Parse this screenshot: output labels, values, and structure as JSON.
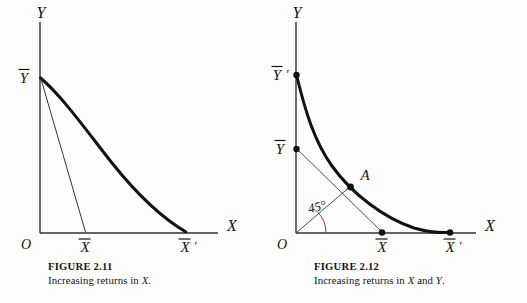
{
  "page": {
    "background": "#fdfdfc",
    "ink": "#141414"
  },
  "figures": [
    {
      "id": "figure-2-11",
      "caption_title": "FIGURE 2.11",
      "caption_text_pre": "Increasing returns in ",
      "caption_text_italic": "X",
      "caption_text_post": ".",
      "axes": {
        "y_axis_label": "Y",
        "x_axis_label": "X",
        "origin_label": "O"
      },
      "ticks": {
        "y": [
          {
            "name": "y-bar",
            "label": "Ȳ",
            "latex": "\\bar{Y}",
            "value": 1.0,
            "dot": false
          }
        ],
        "x": [
          {
            "name": "x-bar",
            "label": "X̄",
            "latex": "\\bar{X}",
            "value": 0.31,
            "dot": false
          },
          {
            "name": "x-bar-prime",
            "label": "X̄'",
            "latex": "\\bar{X}'",
            "value": 1.0,
            "dot": false
          }
        ]
      },
      "curves": [
        {
          "name": "isoquant-curve",
          "style": "thick",
          "description": "convex decreasing curve from Y-bar to X-bar-prime"
        },
        {
          "name": "chord-line",
          "style": "thin",
          "description": "straight line from Y-bar to X-bar"
        }
      ],
      "annotations": []
    },
    {
      "id": "figure-2-12",
      "caption_title": "FIGURE 2.12",
      "caption_text_pre": "Increasing returns in ",
      "caption_text_italic": "X",
      "caption_text_mid": " and ",
      "caption_text_italic2": "Y",
      "caption_text_post": ".",
      "axes": {
        "y_axis_label": "Y",
        "x_axis_label": "X",
        "origin_label": "O"
      },
      "ticks": {
        "y": [
          {
            "name": "y-bar-prime",
            "label": "Ȳ'",
            "latex": "\\bar{Y}'",
            "value": 1.0,
            "dot": true
          },
          {
            "name": "y-bar",
            "label": "Ȳ",
            "latex": "\\bar{Y}",
            "value": 0.55,
            "dot": true
          }
        ],
        "x": [
          {
            "name": "x-bar",
            "label": "X̄",
            "latex": "\\bar{X}",
            "value": 0.55,
            "dot": true
          },
          {
            "name": "x-bar-prime",
            "label": "X̄'",
            "latex": "\\bar{X}'",
            "value": 1.0,
            "dot": true
          }
        ]
      },
      "curves": [
        {
          "name": "isoquant-curve",
          "style": "thick",
          "description": "convex decreasing curve from Y-bar-prime to X-bar-prime"
        },
        {
          "name": "chord-line",
          "style": "thin",
          "description": "straight line from Y-bar through A to X-bar"
        },
        {
          "name": "ray-45",
          "style": "thin",
          "description": "45 degree ray from origin O to point A"
        }
      ],
      "annotations": [
        {
          "name": "point-a-label",
          "label": "A",
          "description": "point on curve where 45 degree ray meets the isoquant"
        },
        {
          "name": "angle-45-label",
          "label": "45°",
          "description": "angle between x-axis and ray"
        }
      ]
    }
  ]
}
